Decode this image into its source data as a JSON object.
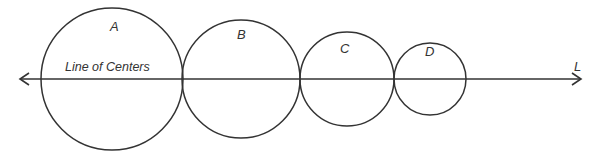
{
  "diagram": {
    "line_label": "Line of Centers",
    "line_end_label": "L",
    "circles": [
      {
        "label": "A",
        "cx": 112,
        "cy": 79,
        "r": 71
      },
      {
        "label": "B",
        "cx": 241,
        "cy": 79,
        "r": 59
      },
      {
        "label": "C",
        "cx": 347,
        "cy": 79,
        "r": 47
      },
      {
        "label": "D",
        "cx": 430,
        "cy": 79,
        "r": 36
      }
    ],
    "stroke_color": "#333333"
  }
}
